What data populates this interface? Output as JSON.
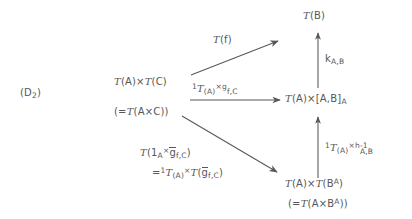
{
  "diagram": {
    "type": "commutative-diagram",
    "tag": "(D₂)",
    "tag_base": "(D",
    "tag_sub": "2",
    "tag_close": ")",
    "nodes": {
      "top_right": {
        "id": "T(B)",
        "text": "T(B)",
        "functor": "T",
        "arg": "(B)"
      },
      "left": {
        "id": "T(A)xT(C)",
        "line1_a": "T",
        "line1_b": "(A)×",
        "line1_c": "T",
        "line1_d": "(C)",
        "line1_plain": "T(A)×T(C)",
        "line2_a": "(=",
        "line2_b": "T",
        "line2_c": "(A×C))",
        "line2_plain": "(=T(A×C))"
      },
      "middle_right": {
        "id": "T(A)x[A,B]_A",
        "a": "T",
        "b": "(A)×[A,B]",
        "sub": "A",
        "plain": "T(A)×[A,B]ₐ"
      },
      "bottom_right": {
        "id": "T(A)xT(B^A)",
        "line1_a": "T",
        "line1_b": "(A)×",
        "line1_c": "T",
        "line1_d": "(B",
        "line1_sup": "A",
        "line1_e": ")",
        "line1_plain": "T(A)×T(Bᴬ)",
        "line2_a": "(=",
        "line2_b": "T",
        "line2_c": "(A×B",
        "line2_sup": "A",
        "line2_d": "))",
        "line2_plain": "(=T(A×Bᴬ))"
      }
    },
    "arrows": [
      {
        "name": "arrow-T-f",
        "from": "T(A)xT(C)",
        "to": "T(B)",
        "direction": "up-right-diagonal",
        "label": {
          "a": "T",
          "b": "(f)",
          "plain": "T(f)"
        }
      },
      {
        "name": "arrow-1TA-times-g",
        "from": "T(A)xT(C)",
        "to": "T(A)x[A,B]_A",
        "direction": "right-horizontal",
        "label": {
          "sup1": "1",
          "a": "T",
          "sub1": "(A)",
          "mid": "×g",
          "sub2": "f,C",
          "plain": "1_T(A)×g_f,C"
        }
      },
      {
        "name": "arrow-k-AB",
        "from": "T(A)x[A,B]_A",
        "to": "T(B)",
        "direction": "up-vertical",
        "label": {
          "a": "k",
          "sub": "A,B",
          "plain": "k_A,B"
        }
      },
      {
        "name": "arrow-1TA-times-h-inv",
        "from": "T(A)xT(B^A)",
        "to": "T(A)x[A,B]_A",
        "direction": "up-vertical",
        "label": {
          "sup1": "1",
          "a": "T",
          "sub1": "(A)",
          "mid": "×h",
          "sup2": "-1",
          "sub2": "A,B",
          "plain": "1_T(A)×h^{-1}_A,B"
        }
      },
      {
        "name": "arrow-T-1A-times-gbar",
        "from": "T(A)xT(C)",
        "to": "T(A)xT(B^A)",
        "direction": "down-right-diagonal",
        "label": {
          "line1_a": "T",
          "line1_b": "(1",
          "line1_sub1": "A",
          "line1_c": "×",
          "line1_gbar": "g",
          "line1_sub2": "f,C",
          "line1_d": ")",
          "line1_plain": "T(1ₐ×ḡ_f,C)",
          "line2_a": "=",
          "line2_sup": "1",
          "line2_b": "T",
          "line2_sub1": "(A)",
          "line2_c": "×",
          "line2_d": "T",
          "line2_e": "(",
          "line2_gbar": "g",
          "line2_sub2": "f,C",
          "line2_f": ")",
          "line2_plain": "=1_T(A)×T(ḡ_f,C)"
        }
      }
    ],
    "colors": {
      "ink": "#575757",
      "background": "#ffffff"
    }
  }
}
